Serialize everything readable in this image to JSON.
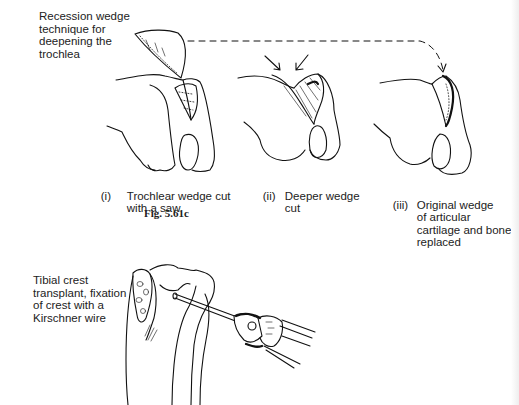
{
  "figure": {
    "caption": "Fig. 5.61c",
    "top_panel": {
      "title_label": "Recession wedge\ntechnique for\ndeepening the\ntrochlea",
      "steps": [
        {
          "numeral": "(i)",
          "text": "Trochlear wedge cut\nwith a saw"
        },
        {
          "numeral": "(ii)",
          "text": "Deeper wedge\ncut"
        },
        {
          "numeral": "(iii)",
          "text": "Original wedge\nof articular\ncartilage and bone\nreplaced"
        }
      ]
    },
    "bottom_panel": {
      "label": "Tibial crest\ntransplant, fixation\nof crest with a\nKirschner wire"
    },
    "illustrations": [
      "femur-trochlear-wedge-cut",
      "femur-deeper-wedge-cut",
      "femur-wedge-replaced",
      "tibia-kirschner-wire-drill"
    ]
  }
}
